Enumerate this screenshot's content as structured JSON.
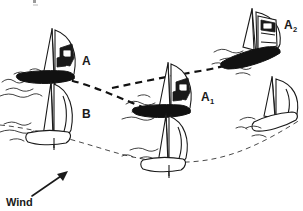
{
  "figure": {
    "background_color": "#ffffff",
    "ink_color": "#1a1a1a",
    "width": 303,
    "height": 211
  },
  "labels": {
    "boat_a": {
      "text": "A",
      "x": 82,
      "y": 65
    },
    "boat_b": {
      "text": "B",
      "x": 82,
      "y": 118
    },
    "boat_a1": {
      "base": "A",
      "sub": "1",
      "x": 201,
      "y": 101
    },
    "boat_a2": {
      "base": "A",
      "sub": "2",
      "x": 284,
      "y": 29
    },
    "wind": {
      "text": "Wind",
      "x": 6,
      "y": 205
    }
  },
  "wind_indicator": {
    "label": "Wind",
    "arrow_from": {
      "x": 32,
      "y": 196
    },
    "arrow_to": {
      "x": 66,
      "y": 172
    },
    "direction": "up-right"
  },
  "boats": [
    {
      "id": "boat-a",
      "label": "A",
      "hull": "dark",
      "hull_color": "#111111",
      "position": {
        "x": 55,
        "y": 78
      },
      "view": "beam",
      "has_crew": true
    },
    {
      "id": "boat-b",
      "label": "B",
      "hull": "light",
      "hull_color": "#ffffff",
      "position": {
        "x": 52,
        "y": 125
      },
      "view": "beam",
      "has_crew": false
    },
    {
      "id": "boat-a1",
      "label": "A1",
      "hull": "dark",
      "hull_color": "#111111",
      "position": {
        "x": 170,
        "y": 110
      },
      "view": "beam",
      "has_crew": true
    },
    {
      "id": "boat-b1",
      "label": "",
      "hull": "light",
      "hull_color": "#ffffff",
      "position": {
        "x": 168,
        "y": 150
      },
      "view": "beam",
      "has_crew": false
    },
    {
      "id": "boat-a2",
      "label": "A2",
      "hull": "dark",
      "hull_color": "#111111",
      "position": {
        "x": 262,
        "y": 38
      },
      "view": "stern",
      "has_crew": true
    },
    {
      "id": "boat-b2",
      "label": "",
      "hull": "light",
      "hull_color": "#ffffff",
      "position": {
        "x": 275,
        "y": 105
      },
      "view": "stern",
      "has_crew": false
    }
  ],
  "tracks": [
    {
      "id": "track-a",
      "belongs_to": "A",
      "style": "bold-dashed",
      "color": "#111111",
      "description": "Path of boat A from left, dipping down through A1, then rising to A2"
    },
    {
      "id": "track-b",
      "belongs_to": "B",
      "style": "thin-dashed",
      "color": "#4a4a4a",
      "description": "Path of boat B from lower left, sagging down and rising to the right"
    }
  ]
}
